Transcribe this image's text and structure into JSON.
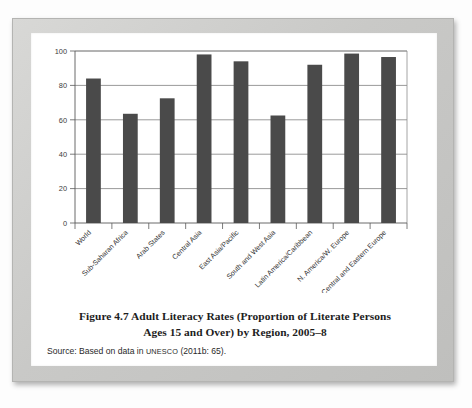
{
  "figure": {
    "caption_line1": "Figure 4.7   Adult Literacy Rates (Proportion of Literate Persons",
    "caption_line2": "Ages 15 and Over) by Region, 2005–8",
    "source_prefix": "Source: Based on data in ",
    "source_org": "UNESCO",
    "source_suffix": " (2011b: 65)."
  },
  "chart_data": {
    "type": "bar",
    "title": "Adult Literacy Rates (Proportion of Literate Persons Ages 15 and Over) by Region, 2005–8",
    "xlabel": "",
    "ylabel": "",
    "ylim": [
      0,
      100
    ],
    "yticks": [
      0,
      20,
      40,
      60,
      80,
      100
    ],
    "ytick_labels": [
      "0",
      "20",
      "40",
      "60",
      "80",
      "100"
    ],
    "grid": true,
    "legend": "none",
    "bar_color": "#4a4a4a",
    "categories": [
      "World",
      "Sub-Saharan Africa",
      "Arab States",
      "Central Asia",
      "East Asia/Pacific",
      "South and West Asia",
      "Latin America/Caribbean",
      "N. America/W. Europe",
      "Central and Eastern Europe"
    ],
    "values": [
      84,
      63.5,
      72.5,
      98,
      94,
      62.5,
      92,
      98.5,
      96.5
    ]
  }
}
